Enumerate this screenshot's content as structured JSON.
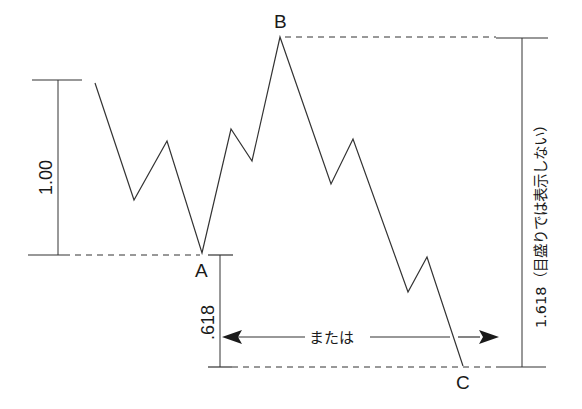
{
  "diagram": {
    "colors": {
      "line": "#333333",
      "text": "#1a1a1a",
      "background": "#ffffff"
    },
    "points": {
      "A": {
        "label": "A"
      },
      "B": {
        "label": "B"
      },
      "C": {
        "label": "C"
      }
    },
    "measurements": {
      "left_range": {
        "label": "1.00"
      },
      "retracement": {
        "label": ".618"
      },
      "extension": {
        "label": "1.618（目盛りでは表示しない）"
      }
    },
    "arrow": {
      "label": "または"
    },
    "price_path": [
      [
        95,
        83
      ],
      [
        134,
        200
      ],
      [
        167,
        141
      ],
      [
        202,
        253
      ],
      [
        231,
        129
      ],
      [
        252,
        161
      ],
      [
        280,
        37
      ],
      [
        331,
        184
      ],
      [
        353,
        139
      ],
      [
        408,
        292
      ],
      [
        427,
        257
      ],
      [
        463,
        366
      ]
    ]
  }
}
